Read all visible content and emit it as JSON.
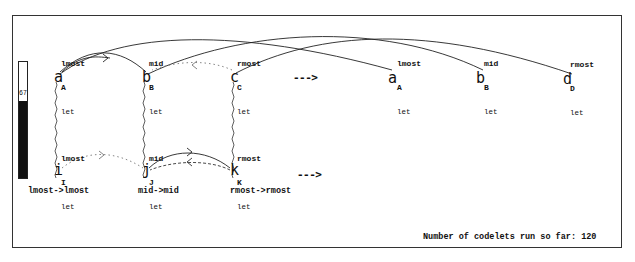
{
  "temperature": {
    "value": "67"
  },
  "initial_string": [
    {
      "letter": "a",
      "desc": "lmost",
      "cat": "A",
      "type": "let"
    },
    {
      "letter": "b",
      "desc": "mid",
      "cat": "B",
      "type": "let"
    },
    {
      "letter": "c",
      "desc": "rmost",
      "cat": "C",
      "type": "let"
    }
  ],
  "modified_string": [
    {
      "letter": "a",
      "desc": "lmost",
      "cat": "A",
      "type": "let"
    },
    {
      "letter": "b",
      "desc": "mid",
      "cat": "B",
      "type": "let"
    },
    {
      "letter": "d",
      "desc": "rmost",
      "cat": "D",
      "type": "let"
    }
  ],
  "target_string": [
    {
      "letter": "i",
      "desc": "lmost",
      "cat": "I",
      "type": "let"
    },
    {
      "letter": "j",
      "desc": "mid",
      "cat": "J",
      "type": "let"
    },
    {
      "letter": "k",
      "desc": "rmost",
      "cat": "K",
      "type": "let"
    }
  ],
  "arrows": {
    "top": "--->",
    "bottom": "--->"
  },
  "mappings": [
    "lmost->lmost",
    "mid->mid",
    "rmost->rmost"
  ],
  "status": {
    "label": "Number of codelets run so far:",
    "count": "120"
  }
}
